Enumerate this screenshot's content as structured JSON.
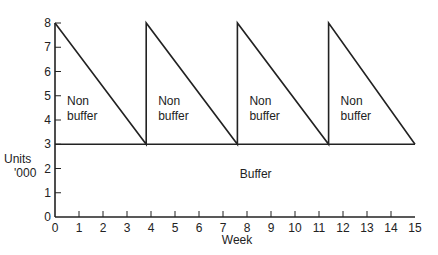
{
  "chart_data": {
    "type": "line",
    "title": "",
    "xlabel": "Week",
    "ylabel": "Units '000",
    "ylabel_lines": [
      "Units",
      "'000"
    ],
    "xlim": [
      0,
      15
    ],
    "ylim": [
      0,
      8
    ],
    "x_ticks": [
      "0",
      "1",
      "2",
      "3",
      "4",
      "5",
      "6",
      "7",
      "8",
      "9",
      "10",
      "11",
      "12",
      "13",
      "14",
      "15"
    ],
    "y_ticks": [
      "0",
      "1",
      "2",
      "3",
      "4",
      "5",
      "6",
      "7",
      "8"
    ],
    "grid": false,
    "legend": null,
    "series": [
      {
        "name": "Stock level (sawtooth)",
        "points": [
          {
            "x": 0,
            "y": 8
          },
          {
            "x": 3.8,
            "y": 3
          },
          {
            "x": 3.8,
            "y": 8
          },
          {
            "x": 7.6,
            "y": 3
          },
          {
            "x": 7.6,
            "y": 8
          },
          {
            "x": 11.4,
            "y": 3
          },
          {
            "x": 11.4,
            "y": 8
          },
          {
            "x": 15,
            "y": 3
          }
        ]
      },
      {
        "name": "Buffer level",
        "points": [
          {
            "x": 0,
            "y": 3
          },
          {
            "x": 15,
            "y": 3
          }
        ]
      }
    ],
    "annotations": [
      {
        "text": "Non buffer",
        "lines": [
          "Non",
          "buffer"
        ],
        "x": 0.5,
        "y": 4.6
      },
      {
        "text": "Non buffer",
        "lines": [
          "Non",
          "buffer"
        ],
        "x": 4.3,
        "y": 4.6
      },
      {
        "text": "Non buffer",
        "lines": [
          "Non",
          "buffer"
        ],
        "x": 8.1,
        "y": 4.6
      },
      {
        "text": "Non buffer",
        "lines": [
          "Non",
          "buffer"
        ],
        "x": 11.9,
        "y": 4.6
      },
      {
        "text": "Buffer",
        "lines": [
          "Buffer"
        ],
        "x": 7.7,
        "y": 1.6
      }
    ]
  }
}
